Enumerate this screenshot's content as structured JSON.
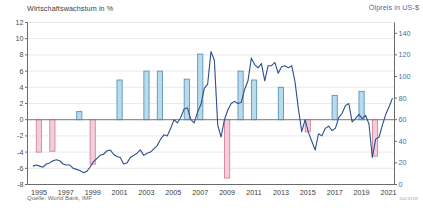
{
  "titles": {
    "left_axis": "Wirtschaftswachstum in %",
    "right_axis": "Ölpreis in US-$"
  },
  "source": "Quelle: World Bank, IMF",
  "code": "5023169",
  "colors": {
    "bar_positive_fill": "#b9dcec",
    "bar_positive_stroke": "#5d92b8",
    "bar_negative_fill": "#f4cddb",
    "bar_negative_stroke": "#d3849e",
    "line": "#2c4f8c",
    "axis": "#6b6b6b",
    "grid": "#e3e3e3",
    "right_axis_text": "#3f6fa8"
  },
  "chart_data": {
    "type": "bar",
    "xlabel": "",
    "ylabel": "Wirtschaftswachstum in %",
    "y2label": "Ölpreis in US-$",
    "ylim": [
      -8,
      12
    ],
    "y2lim": [
      0,
      150
    ],
    "yticks": [
      12,
      10,
      8,
      6,
      4,
      2,
      0,
      -2,
      -4,
      -6,
      -8
    ],
    "y2ticks": [
      140,
      120,
      100,
      80,
      60,
      40,
      20,
      0
    ],
    "xticks": [
      "1995",
      "1997",
      "1999",
      "2001",
      "2003",
      "2005",
      "2007",
      "2009",
      "2011",
      "2013",
      "2015",
      "2017",
      "2019",
      "2021"
    ],
    "grid": true,
    "legend": "none",
    "series": [
      {
        "name": "Wirtschaftswachstum in %",
        "type": "bar",
        "axis": "left",
        "categories": [
          1995,
          1996,
          1997,
          1998,
          1999,
          2000,
          2001,
          2002,
          2003,
          2004,
          2005,
          2006,
          2007,
          2008,
          2009,
          2010,
          2011,
          2012,
          2013,
          2014,
          2015,
          2016,
          2017,
          2018,
          2019,
          2020,
          2021
        ],
        "values": [
          -4.0,
          -3.9,
          0.0,
          1.0,
          -5.5,
          0.0,
          4.9,
          0.0,
          6.0,
          6.0,
          0.0,
          5.0,
          8.1,
          0.0,
          -7.2,
          6.0,
          4.9,
          0.0,
          4.0,
          0.0,
          -1.5,
          0.0,
          3.0,
          0.0,
          3.5,
          -4.5,
          0.0
        ]
      },
      {
        "name": "Ölpreis in US-$",
        "type": "line",
        "axis": "right",
        "x": [
          1995.0,
          1995.25,
          1995.5,
          1995.75,
          1996.0,
          1996.25,
          1996.5,
          1996.75,
          1997.0,
          1997.25,
          1997.5,
          1997.75,
          1998.0,
          1998.25,
          1998.5,
          1998.75,
          1999.0,
          1999.25,
          1999.5,
          1999.75,
          2000.0,
          2000.25,
          2000.5,
          2000.75,
          2001.0,
          2001.25,
          2001.5,
          2001.75,
          2002.0,
          2002.25,
          2002.5,
          2002.75,
          2003.0,
          2003.25,
          2003.5,
          2003.75,
          2004.0,
          2004.25,
          2004.5,
          2004.75,
          2005.0,
          2005.25,
          2005.5,
          2005.75,
          2006.0,
          2006.25,
          2006.5,
          2006.75,
          2007.0,
          2007.25,
          2007.5,
          2007.75,
          2008.0,
          2008.25,
          2008.5,
          2008.75,
          2009.0,
          2009.25,
          2009.5,
          2009.75,
          2010.0,
          2010.25,
          2010.5,
          2010.75,
          2011.0,
          2011.25,
          2011.5,
          2011.75,
          2012.0,
          2012.25,
          2012.5,
          2012.75,
          2013.0,
          2013.25,
          2013.5,
          2013.75,
          2014.0,
          2014.25,
          2014.5,
          2014.75,
          2015.0,
          2015.25,
          2015.5,
          2015.75,
          2016.0,
          2016.25,
          2016.5,
          2016.75,
          2017.0,
          2017.25,
          2017.5,
          2017.75,
          2018.0,
          2018.25,
          2018.5,
          2018.75,
          2019.0,
          2019.25,
          2019.5,
          2019.75,
          2020.0,
          2020.25,
          2020.5,
          2020.75,
          2021.0,
          2021.25,
          2021.5,
          2021.75
        ],
        "y": [
          17,
          18,
          17,
          16,
          19,
          20,
          22,
          23,
          22,
          19,
          18,
          18,
          15,
          14,
          13,
          11,
          12,
          16,
          21,
          24,
          27,
          28,
          31,
          32,
          28,
          26,
          25,
          19,
          20,
          25,
          27,
          29,
          32,
          27,
          29,
          30,
          33,
          36,
          42,
          46,
          45,
          52,
          60,
          57,
          62,
          70,
          71,
          60,
          57,
          67,
          74,
          89,
          93,
          123,
          115,
          55,
          44,
          60,
          69,
          75,
          77,
          75,
          76,
          88,
          96,
          117,
          111,
          108,
          112,
          96,
          110,
          110,
          113,
          103,
          109,
          110,
          108,
          110,
          95,
          70,
          49,
          60,
          48,
          40,
          32,
          47,
          45,
          52,
          54,
          50,
          52,
          62,
          66,
          73,
          75,
          58,
          61,
          65,
          61,
          64,
          56,
          25,
          42,
          44,
          55,
          65,
          72,
          80
        ]
      }
    ]
  }
}
